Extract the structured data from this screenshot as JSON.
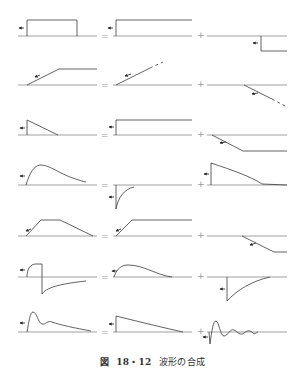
{
  "figure": {
    "caption": {
      "prefix": "図",
      "number": "18・12",
      "title": "波形の合成"
    },
    "operators": {
      "equals": "=",
      "plus": "+"
    },
    "rows": [
      {
        "id": 1,
        "total": "rectangular pulse",
        "part1": "positive step",
        "part2": "delayed negative step"
      },
      {
        "id": 2,
        "total": "ramp to constant",
        "part1": "ramp (continuing, dashed)",
        "part2": "delayed negative ramp (dashed)"
      },
      {
        "id": 3,
        "total": "triangular pulse (step then decay)",
        "part1": "positive step",
        "part2": "negative ramp to constant"
      },
      {
        "id": 4,
        "total": "smooth rise and decay",
        "part1": "negative exponential recovery",
        "part2": "positive exponential decay"
      },
      {
        "id": 5,
        "total": "trapezoid",
        "part1": "ramp to constant",
        "part2": "delayed negative ramp to constant"
      },
      {
        "id": 6,
        "total": "bipolar pulse",
        "part1": "positive rise and decay",
        "part2": "negative step with exponential recovery"
      },
      {
        "id": 7,
        "total": "peak with ringing tail",
        "part1": "step with linear decay",
        "part2": "damped oscillation"
      }
    ],
    "colors": {
      "line": "#3a3a3a",
      "axis": "#555555",
      "operator": "#9a9a9a",
      "caption": "#333333"
    }
  }
}
